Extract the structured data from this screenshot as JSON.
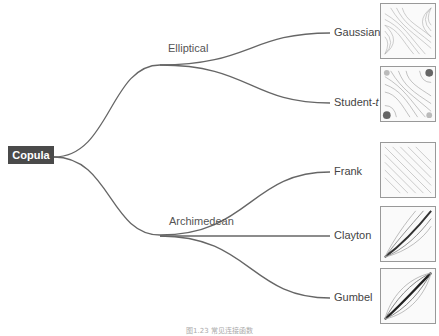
{
  "root": {
    "label": "Copula"
  },
  "families": [
    {
      "label": "Elliptical",
      "members": [
        "Gaussian",
        "Student-t"
      ]
    },
    {
      "label": "Archimedean",
      "members": [
        "Frank",
        "Clayton",
        "Gumbel"
      ]
    }
  ],
  "leaves": {
    "gaussian": "Gaussian",
    "student_t": "Student-",
    "student_t_italic": "t",
    "frank": "Frank",
    "clayton": "Clayton",
    "gumbel": "Gumbel"
  },
  "thumbnails": [
    {
      "name": "Gaussian",
      "icon": "contour-plot"
    },
    {
      "name": "Student-t",
      "icon": "contour-plot"
    },
    {
      "name": "Frank",
      "icon": "contour-plot"
    },
    {
      "name": "Clayton",
      "icon": "contour-plot"
    },
    {
      "name": "Gumbel",
      "icon": "contour-plot"
    }
  ],
  "caption": "图1.23   常见连接函数",
  "colors": {
    "line": "#666666",
    "root_bg": "#4a4a4a",
    "text": "#555555"
  }
}
